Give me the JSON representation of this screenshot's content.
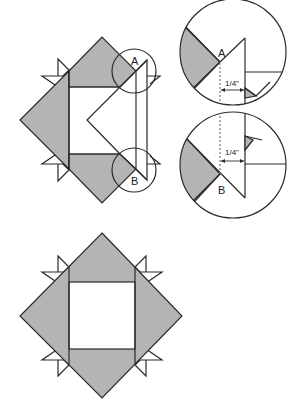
{
  "figure": {
    "type": "quilt-block-construction-diagram",
    "colors": {
      "fill_gray": "#b4b4b4",
      "line": "#2a2a2a",
      "background": "#ffffff"
    },
    "top_diagram": {
      "labels": {
        "point_a": "A",
        "point_b": "B"
      }
    },
    "detail_a": {
      "label": "A",
      "seam_allowance": "1/4\""
    },
    "detail_b": {
      "label": "B",
      "seam_allowance": "1/4\""
    },
    "bottom_diagram": {
      "description": "Completed square-in-a-square block with star points"
    }
  }
}
